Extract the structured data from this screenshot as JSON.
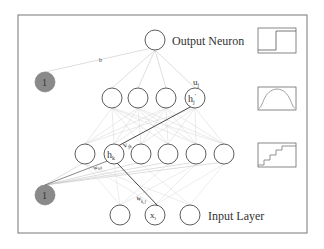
{
  "labels": {
    "output_neuron": "Output Neuron",
    "input_layer": "Input Layer",
    "bias_top": "1",
    "bias_bottom": "1",
    "weight_bias_output": "b",
    "weight_output": "u",
    "weight_output_sub": "j",
    "hidden2_node": "h",
    "hidden2_node_sub": "j",
    "hidden2_node_sup": "'",
    "weight_hidden": "v",
    "weight_hidden_sub": "jk",
    "hidden1_node": "h",
    "hidden1_node_sub": "k",
    "weight_bias_hidden": "w",
    "weight_bias_hidden_sub": "k0",
    "weight_input": "w",
    "weight_input_sub": "k,l",
    "input_node": "x",
    "input_node_sub": "l"
  },
  "activation_icons": [
    {
      "name": "step-function-icon",
      "layer": "output"
    },
    {
      "name": "sigmoid-bump-icon",
      "layer": "hidden2"
    },
    {
      "name": "staircase-function-icon",
      "layer": "hidden1"
    }
  ],
  "layers": {
    "output": {
      "count": 1
    },
    "hidden2": {
      "count": 4
    },
    "hidden1": {
      "count": 6
    },
    "input": {
      "count": 3
    }
  },
  "colors": {
    "frame": "#777777",
    "node_stroke": "#333333",
    "bias_fill": "#8a8a8a",
    "edge_light": "#cfcfcf",
    "edge_highlight": "#333333"
  }
}
